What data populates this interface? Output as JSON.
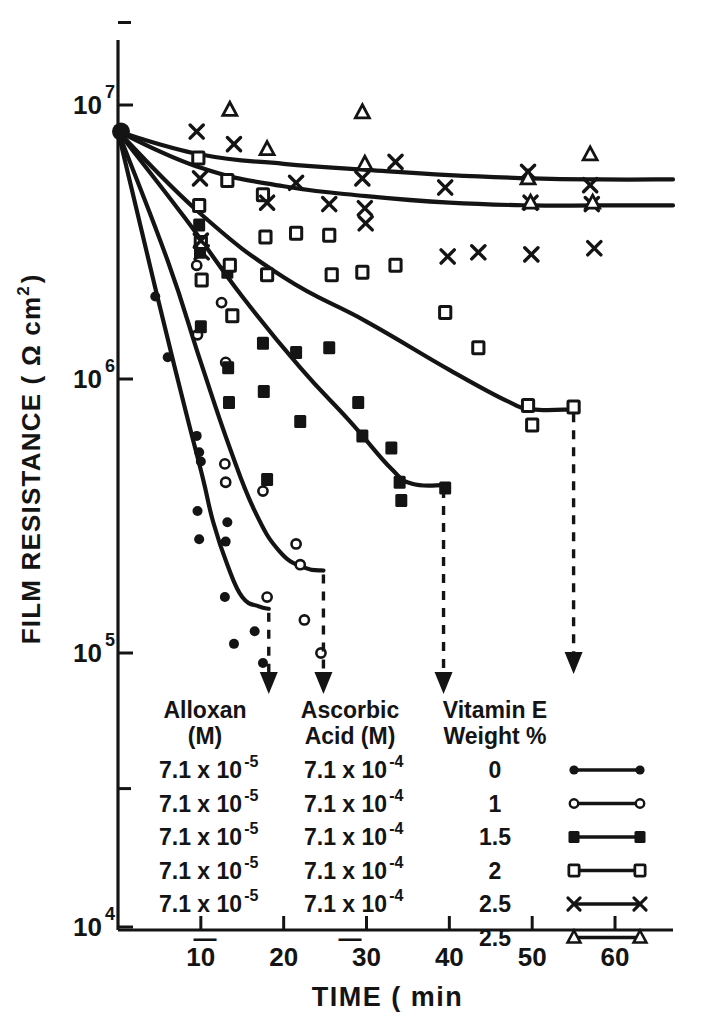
{
  "figure": {
    "ylabel": "FILM RESISTANCE (",
    "ylabel_unit": "Ω cm",
    "ylabel_sup": "2",
    "ylabel_close": ")",
    "xlabel": "TIME ( min"
  },
  "yticks": [
    {
      "base": "10",
      "exp": "7",
      "value": 10000000
    },
    {
      "base": "10",
      "exp": "6",
      "value": 1000000
    },
    {
      "base": "10",
      "exp": "5",
      "value": 100000
    },
    {
      "base": "10",
      "exp": "4",
      "value": 10000
    }
  ],
  "xticks": [
    "10",
    "20",
    "30",
    "40",
    "50",
    "60"
  ],
  "legend": {
    "headers": [
      {
        "line1": "Alloxan",
        "line2": "(M)"
      },
      {
        "line1": "Ascorbic",
        "line2": "Acid (M)"
      },
      {
        "line1": "Vitamin E",
        "line2": "Weight %"
      }
    ],
    "rows": [
      {
        "alloxan_mant": "7.1 x 10",
        "alloxan_exp": "-5",
        "ascorbic_mant": "7.1 x 10",
        "ascorbic_exp": "-4",
        "vitamin_e": "0",
        "marker": "filled-circle"
      },
      {
        "alloxan_mant": "7.1 x 10",
        "alloxan_exp": "-5",
        "ascorbic_mant": "7.1 x 10",
        "ascorbic_exp": "-4",
        "vitamin_e": "1",
        "marker": "open-circle"
      },
      {
        "alloxan_mant": "7.1 x 10",
        "alloxan_exp": "-5",
        "ascorbic_mant": "7.1 x 10",
        "ascorbic_exp": "-4",
        "vitamin_e": "1.5",
        "marker": "filled-square"
      },
      {
        "alloxan_mant": "7.1 x 10",
        "alloxan_exp": "-5",
        "ascorbic_mant": "7.1 x 10",
        "ascorbic_exp": "-4",
        "vitamin_e": "2",
        "marker": "open-square"
      },
      {
        "alloxan_mant": "7.1 x 10",
        "alloxan_exp": "-5",
        "ascorbic_mant": "7.1 x 10",
        "ascorbic_exp": "-4",
        "vitamin_e": "2.5",
        "marker": "cross"
      },
      {
        "alloxan_mant": "—",
        "alloxan_exp": "",
        "ascorbic_mant": "—",
        "ascorbic_exp": "",
        "vitamin_e": "2.5",
        "marker": "open-triangle"
      }
    ]
  },
  "chart_data": {
    "type": "scatter",
    "title": "",
    "xlabel": "TIME ( min",
    "ylabel": "FILM RESISTANCE ( Ω cm2 )",
    "xlim": [
      0,
      67
    ],
    "ylim": [
      10000,
      20000000
    ],
    "yscale": "log",
    "xscale": "linear",
    "grid": false,
    "legend_position": "inside-bottom",
    "series": [
      {
        "name": "Vitamin E 0 %",
        "marker": "filled-circle",
        "alloxan_M": 7.1e-05,
        "ascorbic_acid_M": 0.00071,
        "vitamin_e_weight_pct": 0,
        "points": [
          {
            "x": 0,
            "y": 8000000
          },
          {
            "x": 4.5,
            "y": 2000000
          },
          {
            "x": 6.0,
            "y": 1200000
          },
          {
            "x": 9.5,
            "y": 620000
          },
          {
            "x": 9.8,
            "y": 540000
          },
          {
            "x": 10.0,
            "y": 500000
          },
          {
            "x": 9.6,
            "y": 330000
          },
          {
            "x": 9.8,
            "y": 260000
          },
          {
            "x": 13.0,
            "y": 420000
          },
          {
            "x": 13.2,
            "y": 300000
          },
          {
            "x": 13.0,
            "y": 255000
          },
          {
            "x": 12.9,
            "y": 160000
          },
          {
            "x": 14.0,
            "y": 108000
          },
          {
            "x": 16.5,
            "y": 120000
          },
          {
            "x": 17.5,
            "y": 92000
          }
        ],
        "curve": [
          {
            "x": 0,
            "y": 8000000
          },
          {
            "x": 4.5,
            "y": 2150000
          },
          {
            "x": 8.0,
            "y": 800000
          },
          {
            "x": 10.2,
            "y": 440000
          },
          {
            "x": 11.5,
            "y": 300000
          },
          {
            "x": 13.2,
            "y": 210000
          },
          {
            "x": 15.0,
            "y": 160000
          },
          {
            "x": 17.0,
            "y": 148000
          },
          {
            "x": 18.2,
            "y": 145000
          }
        ],
        "drop_arrow_x": 18.2
      },
      {
        "name": "Vitamin E 1 %",
        "marker": "open-circle",
        "alloxan_M": 7.1e-05,
        "ascorbic_acid_M": 0.00071,
        "vitamin_e_weight_pct": 1,
        "points": [
          {
            "x": 0,
            "y": 8000000
          },
          {
            "x": 9.5,
            "y": 2600000
          },
          {
            "x": 9.6,
            "y": 1450000
          },
          {
            "x": 12.5,
            "y": 1900000
          },
          {
            "x": 13.0,
            "y": 1150000
          },
          {
            "x": 12.9,
            "y": 490000
          },
          {
            "x": 13.0,
            "y": 420000
          },
          {
            "x": 17.5,
            "y": 390000
          },
          {
            "x": 18.0,
            "y": 160000
          },
          {
            "x": 21.5,
            "y": 250000
          },
          {
            "x": 22.0,
            "y": 210000
          },
          {
            "x": 22.5,
            "y": 132000
          },
          {
            "x": 24.5,
            "y": 100000
          }
        ],
        "curve": [
          {
            "x": 0,
            "y": 8000000
          },
          {
            "x": 6.0,
            "y": 2700000
          },
          {
            "x": 10.0,
            "y": 1150000
          },
          {
            "x": 13.5,
            "y": 560000
          },
          {
            "x": 16.5,
            "y": 330000
          },
          {
            "x": 19.5,
            "y": 235000
          },
          {
            "x": 22.5,
            "y": 205000
          },
          {
            "x": 24.8,
            "y": 200000
          }
        ],
        "drop_arrow_x": 24.8
      },
      {
        "name": "Vitamin E 1.5 %",
        "marker": "filled-square",
        "alloxan_M": 7.1e-05,
        "ascorbic_acid_M": 0.00071,
        "vitamin_e_weight_pct": 1.5,
        "points": [
          {
            "x": 0,
            "y": 8000000
          },
          {
            "x": 9.8,
            "y": 3650000
          },
          {
            "x": 9.9,
            "y": 2900000
          },
          {
            "x": 10.0,
            "y": 1550000
          },
          {
            "x": 13.2,
            "y": 2450000
          },
          {
            "x": 13.3,
            "y": 1100000
          },
          {
            "x": 13.4,
            "y": 820000
          },
          {
            "x": 17.5,
            "y": 1350000
          },
          {
            "x": 17.6,
            "y": 900000
          },
          {
            "x": 18.0,
            "y": 430000
          },
          {
            "x": 21.5,
            "y": 1250000
          },
          {
            "x": 22.0,
            "y": 700000
          },
          {
            "x": 25.5,
            "y": 1300000
          },
          {
            "x": 29.0,
            "y": 820000
          },
          {
            "x": 29.5,
            "y": 620000
          },
          {
            "x": 33.0,
            "y": 560000
          },
          {
            "x": 34.0,
            "y": 420000
          },
          {
            "x": 34.2,
            "y": 360000
          },
          {
            "x": 39.5,
            "y": 400000
          }
        ],
        "curve": [
          {
            "x": 0,
            "y": 8000000
          },
          {
            "x": 8.0,
            "y": 3900000
          },
          {
            "x": 15.0,
            "y": 2000000
          },
          {
            "x": 22.0,
            "y": 1100000
          },
          {
            "x": 28.0,
            "y": 700000
          },
          {
            "x": 33.0,
            "y": 470000
          },
          {
            "x": 35.5,
            "y": 415000
          },
          {
            "x": 39.3,
            "y": 410000
          }
        ],
        "drop_arrow_x": 39.3
      },
      {
        "name": "Vitamin E 2 %",
        "marker": "open-square",
        "alloxan_M": 7.1e-05,
        "ascorbic_acid_M": 0.00071,
        "vitamin_e_weight_pct": 2,
        "points": [
          {
            "x": 0,
            "y": 8000000
          },
          {
            "x": 9.7,
            "y": 6400000
          },
          {
            "x": 9.8,
            "y": 4300000
          },
          {
            "x": 10.0,
            "y": 3150000
          },
          {
            "x": 10.1,
            "y": 2300000
          },
          {
            "x": 13.2,
            "y": 5300000
          },
          {
            "x": 13.5,
            "y": 2600000
          },
          {
            "x": 13.8,
            "y": 1700000
          },
          {
            "x": 17.5,
            "y": 4700000
          },
          {
            "x": 17.8,
            "y": 3300000
          },
          {
            "x": 18.0,
            "y": 2400000
          },
          {
            "x": 21.5,
            "y": 3400000
          },
          {
            "x": 25.5,
            "y": 3350000
          },
          {
            "x": 25.8,
            "y": 2400000
          },
          {
            "x": 29.5,
            "y": 2450000
          },
          {
            "x": 33.5,
            "y": 2600000
          },
          {
            "x": 39.5,
            "y": 1750000
          },
          {
            "x": 43.5,
            "y": 1300000
          },
          {
            "x": 49.5,
            "y": 800000
          },
          {
            "x": 50.0,
            "y": 680000
          },
          {
            "x": 55.0,
            "y": 790000
          }
        ],
        "curve": [
          {
            "x": 0,
            "y": 8000000
          },
          {
            "x": 10.0,
            "y": 4000000
          },
          {
            "x": 20.0,
            "y": 2350000
          },
          {
            "x": 30.0,
            "y": 1620000
          },
          {
            "x": 40.0,
            "y": 1080000
          },
          {
            "x": 47.0,
            "y": 830000
          },
          {
            "x": 50.0,
            "y": 775000
          },
          {
            "x": 55.0,
            "y": 775000
          }
        ],
        "drop_arrow_x": 55.0
      },
      {
        "name": "Vitamin E 2.5 % (with alloxan / ascorbic acid)",
        "marker": "cross",
        "alloxan_M": 7.1e-05,
        "ascorbic_acid_M": 0.00071,
        "vitamin_e_weight_pct": 2.5,
        "points": [
          {
            "x": 0,
            "y": 8000000
          },
          {
            "x": 9.5,
            "y": 8000000
          },
          {
            "x": 9.9,
            "y": 5400000
          },
          {
            "x": 10.0,
            "y": 3200000
          },
          {
            "x": 10.1,
            "y": 2900000
          },
          {
            "x": 14.0,
            "y": 7200000
          },
          {
            "x": 18.0,
            "y": 4400000
          },
          {
            "x": 21.5,
            "y": 5200000
          },
          {
            "x": 25.5,
            "y": 4350000
          },
          {
            "x": 29.5,
            "y": 5400000
          },
          {
            "x": 29.8,
            "y": 4200000
          },
          {
            "x": 29.9,
            "y": 3700000
          },
          {
            "x": 33.5,
            "y": 6200000
          },
          {
            "x": 39.5,
            "y": 5000000
          },
          {
            "x": 39.8,
            "y": 2800000
          },
          {
            "x": 43.5,
            "y": 2900000
          },
          {
            "x": 49.5,
            "y": 5700000
          },
          {
            "x": 49.8,
            "y": 4400000
          },
          {
            "x": 49.9,
            "y": 2850000
          },
          {
            "x": 57.0,
            "y": 5100000
          },
          {
            "x": 57.2,
            "y": 4350000
          },
          {
            "x": 57.5,
            "y": 3000000
          }
        ],
        "curve": [
          {
            "x": 0,
            "y": 8000000
          },
          {
            "x": 10.0,
            "y": 5900000
          },
          {
            "x": 20.0,
            "y": 5050000
          },
          {
            "x": 30.0,
            "y": 4650000
          },
          {
            "x": 40.0,
            "y": 4400000
          },
          {
            "x": 50.0,
            "y": 4300000
          },
          {
            "x": 58.0,
            "y": 4300000
          },
          {
            "x": 67.0,
            "y": 4300000
          }
        ],
        "drop_arrow_x": null
      },
      {
        "name": "Vitamin E 2.5 % (control, no alloxan / ascorbic acid)",
        "marker": "open-triangle",
        "alloxan_M": null,
        "ascorbic_acid_M": null,
        "vitamin_e_weight_pct": 2.5,
        "points": [
          {
            "x": 0,
            "y": 8000000
          },
          {
            "x": 13.5,
            "y": 9600000
          },
          {
            "x": 18.0,
            "y": 6900000
          },
          {
            "x": 29.5,
            "y": 9400000
          },
          {
            "x": 29.8,
            "y": 6100000
          },
          {
            "x": 49.5,
            "y": 5400000
          },
          {
            "x": 49.8,
            "y": 4400000
          },
          {
            "x": 57.0,
            "y": 6600000
          },
          {
            "x": 57.3,
            "y": 4400000
          }
        ],
        "curve": [
          {
            "x": 0,
            "y": 8000000
          },
          {
            "x": 10.0,
            "y": 6600000
          },
          {
            "x": 20.0,
            "y": 6100000
          },
          {
            "x": 30.0,
            "y": 5800000
          },
          {
            "x": 40.0,
            "y": 5550000
          },
          {
            "x": 50.0,
            "y": 5400000
          },
          {
            "x": 58.0,
            "y": 5350000
          },
          {
            "x": 67.0,
            "y": 5350000
          }
        ],
        "drop_arrow_x": null
      }
    ]
  },
  "colors": {
    "ink": "#141414",
    "background": "#ffffff"
  }
}
